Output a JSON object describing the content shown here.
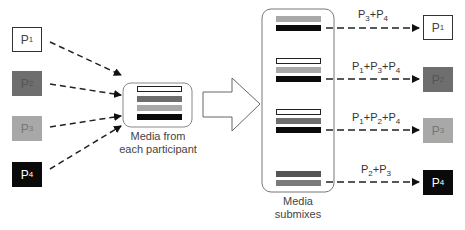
{
  "diagram": {
    "type": "audio-conference-mixing",
    "participants_left": [
      {
        "id": "p1",
        "label": "P",
        "sub": "1",
        "fill": "#ffffff",
        "text": "#444444"
      },
      {
        "id": "p2",
        "label": "P",
        "sub": "2",
        "fill": "#6e6e6e",
        "text": "#555555"
      },
      {
        "id": "p3",
        "label": "P",
        "sub": "3",
        "fill": "#a8a8a8",
        "text": "#777777"
      },
      {
        "id": "p4",
        "label": "P",
        "sub": "4",
        "fill": "#0a0a0a",
        "text": "#ffffff"
      }
    ],
    "collector": {
      "caption_line1": "Media from",
      "caption_line2": "each participant",
      "bars": [
        "#ffffff",
        "#6e6e6e",
        "#a8a8a8",
        "#0a0a0a"
      ]
    },
    "arrow": "block-arrow-right",
    "submixes": {
      "caption_line1": "Media",
      "caption_line2": "submixes",
      "groups": [
        {
          "bars": [
            "#a8a8a8",
            "#0a0a0a"
          ],
          "label": {
            "parts": [
              [
                "P",
                "3"
              ],
              [
                "+P",
                "4"
              ]
            ]
          },
          "target": "P1"
        },
        {
          "bars": [
            "#ffffff",
            "#a8a8a8",
            "#0a0a0a"
          ],
          "label": {
            "parts": [
              [
                "P",
                "1"
              ],
              [
                "+P",
                "3"
              ],
              [
                "+P",
                "4"
              ]
            ]
          },
          "target": "P2"
        },
        {
          "bars": [
            "#ffffff",
            "#6e6e6e",
            "#0a0a0a"
          ],
          "label": {
            "parts": [
              [
                "P",
                "1"
              ],
              [
                "+P",
                "2"
              ],
              [
                "+P",
                "4"
              ]
            ]
          },
          "target": "P3"
        },
        {
          "bars": [
            "#555555",
            "#7a7a7a"
          ],
          "label": {
            "parts": [
              [
                "P",
                "2"
              ],
              [
                "+P",
                "3"
              ]
            ]
          },
          "target": "P4"
        }
      ]
    },
    "participants_right": [
      {
        "id": "p1",
        "label": "P",
        "sub": "1",
        "fill": "#ffffff",
        "text": "#444444"
      },
      {
        "id": "p2",
        "label": "P",
        "sub": "2",
        "fill": "#6e6e6e",
        "text": "#555555"
      },
      {
        "id": "p3",
        "label": "P",
        "sub": "3",
        "fill": "#a8a8a8",
        "text": "#777777"
      },
      {
        "id": "p4",
        "label": "P",
        "sub": "4",
        "fill": "#0a0a0a",
        "text": "#ffffff"
      }
    ],
    "mix_labels": {
      "m1": {
        "a": "P",
        "a_sub": "3",
        "b": "+P",
        "b_sub": "4"
      },
      "m2": {
        "a": "P",
        "a_sub": "1",
        "b": "+P",
        "b_sub": "3",
        "c": "+P",
        "c_sub": "4"
      },
      "m3": {
        "a": "P",
        "a_sub": "1",
        "b": "+P",
        "b_sub": "2",
        "c": "+P",
        "c_sub": "4"
      },
      "m4": {
        "a": "P",
        "a_sub": "2",
        "b": "+P",
        "b_sub": "3"
      }
    }
  }
}
